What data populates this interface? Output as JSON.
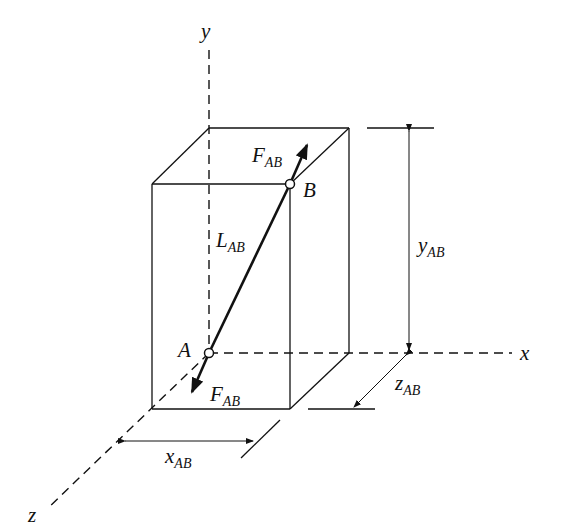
{
  "diagram": {
    "axes": {
      "x": "x",
      "y": "y",
      "z": "z"
    },
    "points": {
      "A": "A",
      "B": "B"
    },
    "force": {
      "main": "F",
      "sub": "AB"
    },
    "length": {
      "main": "L",
      "sub": "AB"
    },
    "dimensions": {
      "x": {
        "main": "x",
        "sub": "AB"
      },
      "y": {
        "main": "y",
        "sub": "AB"
      },
      "z": {
        "main": "z",
        "sub": "AB"
      }
    },
    "colors": {
      "line": "#111111",
      "background": "#ffffff"
    }
  }
}
